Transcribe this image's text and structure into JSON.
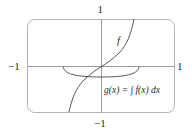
{
  "figure": {
    "type": "function-graph",
    "frame": {
      "shape": "rounded-rectangle",
      "color": "#b0b0b0"
    },
    "axes_color": "#9a9a9a",
    "curve_color": "#444444",
    "ticks": {
      "x_min_label": "−1",
      "x_max_label": "1",
      "y_min_label": "−1",
      "y_max_label": "1"
    },
    "curves": [
      {
        "name": "f",
        "label": "f",
        "description": "increasing odd function through origin, steep near ends"
      },
      {
        "name": "g",
        "label": "g(x) = ∫ f(x) dx",
        "description": "bowl-shaped antiderivative, minimum at x = 0, below the x-axis"
      }
    ],
    "view": {
      "xlim": [
        -1,
        1
      ],
      "ylim": [
        -1,
        1
      ]
    }
  }
}
